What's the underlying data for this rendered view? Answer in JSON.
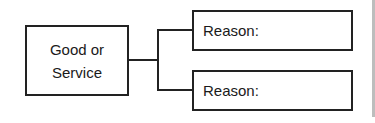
{
  "diagram": {
    "main_node": {
      "line1": "Good or",
      "line2": "Service"
    },
    "branches": [
      {
        "label": "Reason:"
      },
      {
        "label": "Reason:"
      }
    ],
    "colors": {
      "stroke": "#222222",
      "background": "#ffffff",
      "edge_bar": "#bdbdbd"
    }
  }
}
